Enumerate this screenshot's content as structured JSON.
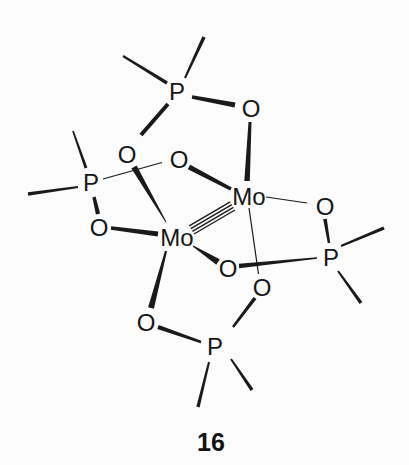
{
  "figure": {
    "compound_number": "16",
    "background_color": "#fcfcfc",
    "ink_color": "#1a1a1a",
    "kind": "hand-drawn chemical structure (scanned)"
  },
  "molecule": {
    "description": "Dimolybdenum complex bridged by four O-P-O phosphinate ligands; each P bears two unlabeled alkyl strokes; the Mo-Mo bond is drawn as four thin parallel lines",
    "metal_metal_bond_lines": 4,
    "atoms": [
      {
        "id": "p-top",
        "symbol": "P"
      },
      {
        "id": "o-top-right",
        "symbol": "O"
      },
      {
        "id": "o-upper-left",
        "symbol": "O"
      },
      {
        "id": "o-upper-center",
        "symbol": "O"
      },
      {
        "id": "p-left",
        "symbol": "P"
      },
      {
        "id": "mo-right",
        "symbol": "Mo"
      },
      {
        "id": "o-right",
        "symbol": "O"
      },
      {
        "id": "o-left",
        "symbol": "O"
      },
      {
        "id": "mo-left",
        "symbol": "Mo"
      },
      {
        "id": "p-right",
        "symbol": "P"
      },
      {
        "id": "o-mid",
        "symbol": "O"
      },
      {
        "id": "o-lower-right",
        "symbol": "O"
      },
      {
        "id": "o-lower-left",
        "symbol": "O"
      },
      {
        "id": "p-bottom",
        "symbol": "P"
      }
    ],
    "bonds": [
      {
        "from": "p-top",
        "to": "o-top-right",
        "style": "bold"
      },
      {
        "from": "p-top",
        "to": "o-upper-left",
        "style": "bold"
      },
      {
        "from": "o-top-right",
        "to": "mo-right",
        "style": "bold-tapered"
      },
      {
        "from": "o-upper-left",
        "to": "mo-left",
        "style": "solid-wedge"
      },
      {
        "from": "p-left",
        "to": "o-upper-center",
        "style": "thin"
      },
      {
        "from": "p-left",
        "to": "o-left",
        "style": "bold"
      },
      {
        "from": "o-upper-center",
        "to": "mo-right",
        "style": "bold"
      },
      {
        "from": "o-left",
        "to": "mo-left",
        "style": "bold"
      },
      {
        "from": "mo-left",
        "to": "mo-right",
        "style": "four-parallel-lines"
      },
      {
        "from": "mo-left",
        "to": "o-mid",
        "style": "solid-wedge"
      },
      {
        "from": "o-mid",
        "to": "p-right",
        "style": "bold-tapered"
      },
      {
        "from": "mo-right",
        "to": "o-right",
        "style": "thin"
      },
      {
        "from": "o-right",
        "to": "p-right",
        "style": "bold"
      },
      {
        "from": "mo-right",
        "to": "o-lower-right",
        "style": "thin"
      },
      {
        "from": "o-lower-right",
        "to": "p-bottom",
        "style": "bold"
      },
      {
        "from": "mo-left",
        "to": "o-lower-left",
        "style": "bold-tapered"
      },
      {
        "from": "o-lower-left",
        "to": "p-bottom",
        "style": "bold"
      }
    ],
    "alkyl_strokes_per_phosphorus": 2
  }
}
